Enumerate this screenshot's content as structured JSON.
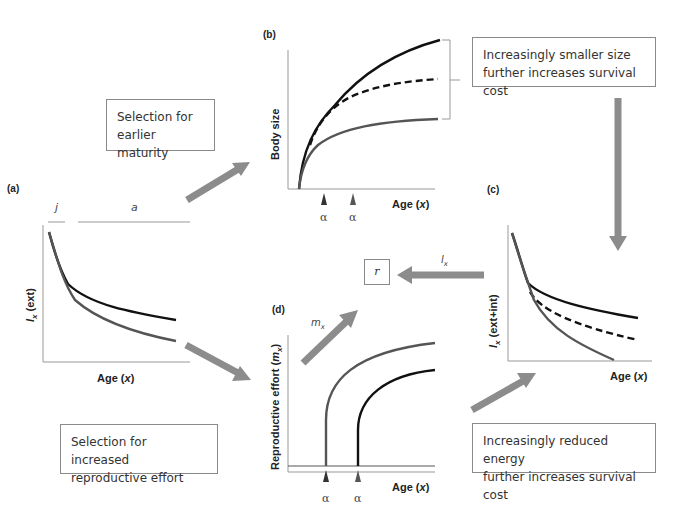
{
  "colors": {
    "curve_black": "#111111",
    "curve_gray": "#555555",
    "arrow_gray": "#8c8c8c",
    "axis": "#999999",
    "box_border": "#8a8a8a"
  },
  "panels": {
    "a": {
      "label": "(a)",
      "stage_labels": {
        "juvenile": "j",
        "adult": "a"
      },
      "ylabel": "lx (ext)",
      "ylabel_sym": "l",
      "ylabel_sub": "x",
      "ylabel_rest": " (ext)",
      "xlabel": "Age (x)",
      "xlabel_main": "Age (",
      "xlabel_var": "x",
      "xlabel_close": ")"
    },
    "b": {
      "label": "(b)",
      "ylabel": "Body size",
      "xlabel_main": "Age (",
      "xlabel_var": "x",
      "xlabel_close": ")",
      "alpha_marks": [
        "α",
        "α"
      ]
    },
    "c": {
      "label": "(c)",
      "ylabel_sym": "l",
      "ylabel_sub": "x",
      "ylabel_rest": " (ext+int)",
      "xlabel_main": "Age (",
      "xlabel_var": "x",
      "xlabel_close": ")"
    },
    "d": {
      "label": "(d)",
      "ylabel_main": "Reproductive effort (",
      "ylabel_var": "m",
      "ylabel_sub": "x",
      "ylabel_close": ")",
      "xlabel_main": "Age (",
      "xlabel_var": "x",
      "xlabel_close": ")",
      "alpha_marks": [
        "α",
        "α"
      ],
      "arrow_label_sym": "m",
      "arrow_label_sub": "x"
    }
  },
  "boxes": {
    "earlier_maturity": "Selection for earlier maturity",
    "earlier_maturity_l1": "Selection for",
    "earlier_maturity_l2": "earlier maturity",
    "smaller_size_l1": "Increasingly smaller size",
    "smaller_size_l2": "further increases survival cost",
    "repro_effort_l1": "Selection for increased",
    "repro_effort_l2": "reproductive effort",
    "reduced_energy_l1": "Increasingly reduced energy",
    "reduced_energy_l2": "further increases survival cost",
    "r": "r"
  },
  "arrows": {
    "lx_label_sym": "l",
    "lx_label_sub": "x"
  }
}
